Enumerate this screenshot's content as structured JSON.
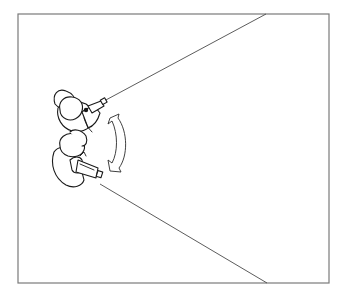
{
  "diagram": {
    "frame": {
      "x": 18,
      "y": 14,
      "width": 311,
      "height": 269,
      "stroke": "#7a7a7a"
    },
    "operators": [
      {
        "id": "upper-operator",
        "label": "Operator with handheld camera (upper)",
        "camera_direction": "up-right"
      },
      {
        "id": "lower-operator",
        "label": "Operator with handheld camera (lower)",
        "camera_direction": "right"
      }
    ],
    "rays": [
      {
        "id": "upper-ray",
        "from": [
          104,
          101
        ],
        "to": [
          266,
          14
        ]
      },
      {
        "id": "lower-ray",
        "from": [
          100,
          184
        ],
        "to": [
          267,
          283
        ]
      }
    ],
    "rotation_arrow": {
      "type": "curved double-headed arrow",
      "from": [
        107,
        116
      ],
      "to": [
        124,
        172
      ]
    },
    "colors": {
      "ink": "#1a1a1a",
      "frame": "#7a7a7a",
      "background": "#ffffff"
    }
  }
}
